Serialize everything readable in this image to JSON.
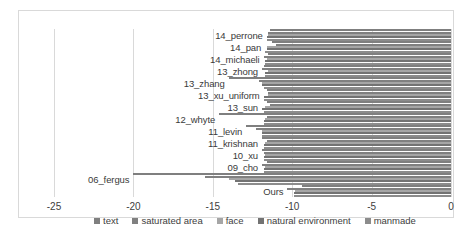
{
  "chart_data": {
    "type": "bar",
    "orientation": "horizontal",
    "stacked": false,
    "grouped": true,
    "title": "",
    "xlabel": "",
    "ylabel": "",
    "xlim": [
      -25,
      0
    ],
    "xticks": [
      -25,
      -20,
      -15,
      -10,
      -5,
      0
    ],
    "xtick_labels": [
      "-25",
      "-20",
      "-15",
      "-10",
      "-5",
      "0"
    ],
    "grid": true,
    "grid_axis": "x",
    "legend_position": "bottom",
    "categories": [
      "14_perrone",
      "14_pan",
      "14_michaeli",
      "13_zhong",
      "13_zhang",
      "13_xu_uniform",
      "13_sun",
      "12_whyte",
      "11_levin",
      "11_krishnan",
      "10_xu",
      "09_cho",
      "06_fergus",
      "Ours"
    ],
    "series": [
      {
        "name": "text",
        "color": "#7f7f7f",
        "values": [
          -11.4,
          -11.3,
          -11.5,
          -11.8,
          -14.0,
          -11.6,
          -11.6,
          -14.6,
          -12.9,
          -11.9,
          -11.9,
          -11.6,
          -20.0,
          -9.4
        ]
      },
      {
        "name": "saturated area",
        "color": "#808080",
        "values": [
          -11.5,
          -11.0,
          -11.8,
          -11.9,
          -12.1,
          -11.5,
          -11.4,
          -11.6,
          -12.3,
          -11.6,
          -11.8,
          -11.9,
          -15.5,
          -10.3
        ]
      },
      {
        "name": "face",
        "color": "#a6a6a6",
        "values": [
          -11.5,
          -11.6,
          -11.6,
          -11.5,
          -11.9,
          -11.5,
          -11.7,
          -11.7,
          -11.9,
          -11.7,
          -11.7,
          -11.7,
          -14.0,
          -9.8
        ]
      },
      {
        "name": "natural environment",
        "color": "#737373",
        "values": [
          -11.6,
          -11.6,
          -11.7,
          -11.7,
          -11.9,
          -11.8,
          -11.9,
          -11.8,
          -11.9,
          -11.8,
          -11.8,
          -11.8,
          -13.6,
          -9.9
        ]
      },
      {
        "name": "manmade",
        "color": "#8c8c8c",
        "values": [
          -11.6,
          -11.7,
          -11.7,
          -11.7,
          -11.8,
          -11.8,
          -11.8,
          -11.8,
          -11.9,
          -11.8,
          -11.8,
          -11.8,
          -13.4,
          -9.9
        ]
      }
    ]
  },
  "legend": {
    "items": [
      {
        "label": "text",
        "color": "#7f7f7f"
      },
      {
        "label": "saturated area",
        "color": "#808080"
      },
      {
        "label": "face",
        "color": "#a6a6a6"
      },
      {
        "label": "natural environment",
        "color": "#737373"
      },
      {
        "label": "manmade",
        "color": "#8c8c8c"
      }
    ]
  }
}
